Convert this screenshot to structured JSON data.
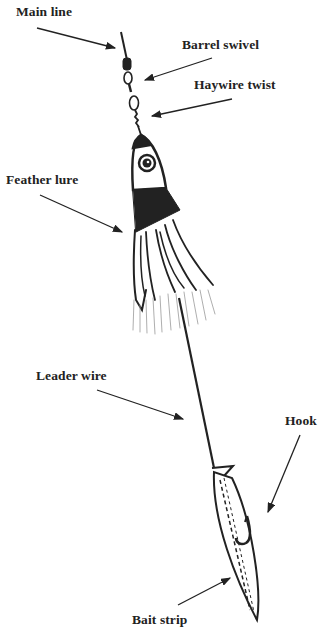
{
  "diagram": {
    "type": "labeled illustration",
    "labels": {
      "main_line": "Main line",
      "barrel_swivel": "Barrel swivel",
      "haywire_twist": "Haywire twist",
      "feather_lure": "Feather lure",
      "leader_wire": "Leader wire",
      "hook": "Hook",
      "bait_strip": "Bait strip"
    },
    "colors": {
      "ink": "#222222",
      "background": "#ffffff"
    }
  }
}
